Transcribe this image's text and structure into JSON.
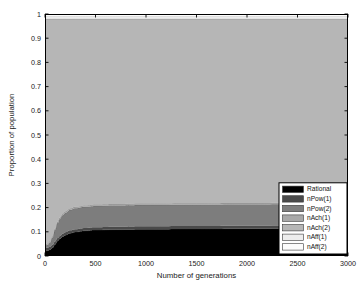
{
  "chart_data": {
    "type": "area",
    "stacked": true,
    "title": "",
    "xlabel": "Number of generations",
    "ylabel": "Proportion of population",
    "xlim": [
      0,
      3000
    ],
    "ylim": [
      0,
      1
    ],
    "xticks": [
      0,
      500,
      1000,
      1500,
      2000,
      2500,
      3000
    ],
    "xtick_labels": [
      "0",
      "500",
      "1000",
      "1500",
      "2000",
      "2500",
      "3000"
    ],
    "yticks": [
      0,
      0.1,
      0.2,
      0.3,
      0.4,
      0.5,
      0.6,
      0.7,
      0.8,
      0.9,
      1
    ],
    "ytick_labels": [
      "0",
      "0.1",
      "0.2",
      "0.3",
      "0.4",
      "0.5",
      "0.6",
      "0.7",
      "0.8",
      "0.9",
      "1"
    ],
    "grid": false,
    "legend_position": "lower right",
    "x": [
      0,
      25,
      50,
      75,
      100,
      125,
      150,
      175,
      200,
      250,
      300,
      400,
      500,
      700,
      1000,
      1500,
      2000,
      2500,
      3000
    ],
    "series": [
      {
        "name": "Rational",
        "color": "#000000",
        "values": [
          0.02,
          0.022,
          0.026,
          0.034,
          0.048,
          0.062,
          0.072,
          0.08,
          0.086,
          0.094,
          0.099,
          0.104,
          0.107,
          0.109,
          0.111,
          0.112,
          0.113,
          0.114,
          0.115
        ]
      },
      {
        "name": "nPow(1)",
        "color": "#4a4a4a",
        "values": [
          0.012,
          0.012,
          0.012,
          0.012,
          0.012,
          0.012,
          0.012,
          0.012,
          0.012,
          0.012,
          0.012,
          0.012,
          0.012,
          0.012,
          0.012,
          0.012,
          0.012,
          0.012,
          0.012
        ]
      },
      {
        "name": "nPow(2)",
        "color": "#7d7d7d",
        "values": [
          0.01,
          0.012,
          0.018,
          0.03,
          0.048,
          0.062,
          0.07,
          0.076,
          0.08,
          0.084,
          0.086,
          0.087,
          0.088,
          0.088,
          0.088,
          0.088,
          0.088,
          0.088,
          0.088
        ]
      },
      {
        "name": "nAch(1)",
        "color": "#a8a8a8",
        "values": [
          0.006,
          0.006,
          0.006,
          0.006,
          0.006,
          0.006,
          0.006,
          0.006,
          0.006,
          0.006,
          0.006,
          0.006,
          0.006,
          0.006,
          0.006,
          0.006,
          0.006,
          0.006,
          0.006
        ]
      },
      {
        "name": "nAch(2)",
        "color": "#b6b6b6",
        "values": [
          0.932,
          0.928,
          0.918,
          0.898,
          0.866,
          0.838,
          0.82,
          0.806,
          0.796,
          0.784,
          0.777,
          0.771,
          0.767,
          0.765,
          0.763,
          0.762,
          0.761,
          0.76,
          0.759
        ]
      },
      {
        "name": "nAff(1)",
        "color": "#ededed",
        "values": [
          0.01,
          0.01,
          0.01,
          0.01,
          0.01,
          0.01,
          0.01,
          0.01,
          0.01,
          0.01,
          0.01,
          0.01,
          0.01,
          0.01,
          0.01,
          0.01,
          0.01,
          0.01,
          0.01
        ]
      },
      {
        "name": "nAff(2)",
        "color": "#fcfcfc",
        "values": [
          0.01,
          0.01,
          0.01,
          0.01,
          0.01,
          0.01,
          0.01,
          0.01,
          0.01,
          0.01,
          0.01,
          0.01,
          0.01,
          0.01,
          0.01,
          0.01,
          0.01,
          0.01,
          0.01
        ]
      }
    ]
  },
  "legend": {
    "entries": [
      {
        "label": "Rational",
        "color": "#000000"
      },
      {
        "label": "nPow(1)",
        "color": "#4a4a4a"
      },
      {
        "label": "nPow(2)",
        "color": "#7d7d7d"
      },
      {
        "label": "nAch(1)",
        "color": "#a8a8a8"
      },
      {
        "label": "nAch(2)",
        "color": "#b6b6b6"
      },
      {
        "label": "nAff(1)",
        "color": "#ededed"
      },
      {
        "label": "nAff(2)",
        "color": "#fcfcfc"
      }
    ]
  },
  "plot_geometry": {
    "left": 45,
    "right": 348,
    "top": 14,
    "bottom": 256
  }
}
